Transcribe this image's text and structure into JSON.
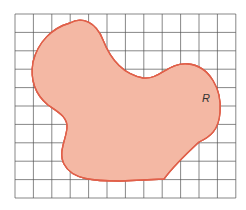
{
  "diagram": {
    "type": "grid-area-estimation",
    "region_label": "R",
    "grid": {
      "columns": 12,
      "rows": 10,
      "origin_x": 15,
      "origin_y": 14,
      "cell_size": 18.4,
      "line_color": "#555555"
    },
    "colors": {
      "region_fill": "#f4b8a4",
      "region_outline": "#e0604a",
      "inside_cell_fill": "#dcefd2"
    },
    "inside_cells": [
      [
        2,
        2
      ],
      [
        2,
        3
      ],
      [
        3,
        2
      ],
      [
        3,
        3
      ],
      [
        3,
        4
      ],
      [
        3,
        5
      ],
      [
        3,
        8
      ],
      [
        3,
        9
      ],
      [
        4,
        3
      ],
      [
        4,
        4
      ],
      [
        4,
        5
      ],
      [
        4,
        6
      ],
      [
        4,
        7
      ],
      [
        4,
        8
      ],
      [
        4,
        9
      ],
      [
        5,
        4
      ],
      [
        5,
        5
      ],
      [
        5,
        6
      ],
      [
        5,
        7
      ],
      [
        5,
        8
      ],
      [
        5,
        9
      ],
      [
        6,
        4
      ],
      [
        6,
        5
      ],
      [
        6,
        6
      ],
      [
        6,
        7
      ],
      [
        6,
        8
      ],
      [
        6,
        9
      ],
      [
        7,
        3
      ],
      [
        7,
        4
      ],
      [
        7,
        5
      ],
      [
        7,
        6
      ],
      [
        7,
        7
      ],
      [
        7,
        8
      ],
      [
        8,
        6
      ]
    ],
    "inside_cell_count": 34
  }
}
